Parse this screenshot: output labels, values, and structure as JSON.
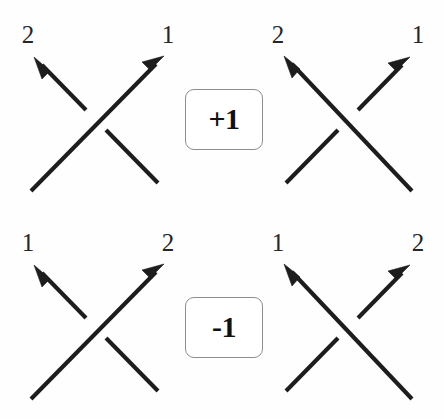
{
  "figure": {
    "background_color": "#fefefe",
    "stroke_color": "#1d1d1d",
    "badge_border_color": "#8d8d8d",
    "label_color": "#262626"
  },
  "rows": [
    {
      "id": "positive-row",
      "sign": "+1",
      "badge_label": "+1",
      "left_diagram": {
        "id": "positive-left",
        "over_strand": "sw-ne",
        "under_strand": "se-nw",
        "labels": {
          "top_left": "2",
          "top_right": "1"
        }
      },
      "right_diagram": {
        "id": "positive-right",
        "over_strand": "se-nw",
        "under_strand": "sw-ne",
        "labels": {
          "top_left": "2",
          "top_right": "1"
        }
      }
    },
    {
      "id": "negative-row",
      "sign": "-1",
      "badge_label": "-1",
      "left_diagram": {
        "id": "negative-left",
        "over_strand": "sw-ne",
        "under_strand": "se-nw",
        "labels": {
          "top_left": "1",
          "top_right": "2"
        }
      },
      "right_diagram": {
        "id": "negative-right",
        "over_strand": "se-nw",
        "under_strand": "sw-ne",
        "labels": {
          "top_left": "1",
          "top_right": "2"
        }
      }
    }
  ],
  "labels": {
    "tl_top_left": "2",
    "tl_top_right": "1",
    "tr_top_left": "2",
    "tr_top_right": "1",
    "bl_top_left": "1",
    "bl_top_right": "2",
    "br_top_left": "1",
    "br_top_right": "2"
  },
  "badges": {
    "top": "+1",
    "bottom": "-1"
  }
}
